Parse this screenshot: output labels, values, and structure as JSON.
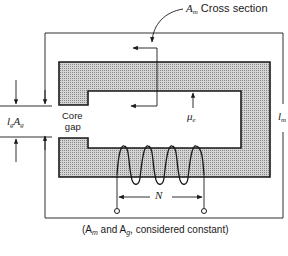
{
  "diagram": {
    "labels": {
      "cross_section_symbol": "A",
      "cross_section_sub": "m",
      "cross_section_text": "Cross section",
      "gap_length_symbol": "l",
      "gap_length_sub": "g",
      "gap_area_symbol": "A",
      "gap_area_sub": "g",
      "core_gap_line1": "Core",
      "core_gap_line2": "gap",
      "permeability_symbol": "μ",
      "permeability_sub": "e",
      "path_length_symbol": "l",
      "path_length_sub": "m",
      "turns_symbol": "N",
      "caption": "(A",
      "caption_sub1": "m",
      "caption_mid": " and A",
      "caption_sub2": "g",
      "caption_end": ", considered constant)"
    },
    "colors": {
      "line": "#1a1a1a",
      "core_fill": "#b8b8b8",
      "background": "#ffffff"
    }
  }
}
